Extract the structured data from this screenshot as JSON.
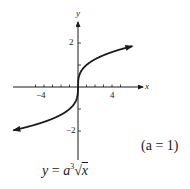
{
  "chart_data": {
    "type": "line",
    "title": "",
    "function": "y = a * cbrt(x)",
    "parameter": {
      "name": "a",
      "value": 1
    },
    "formula_label": "y = a∛x",
    "parameter_label": "(a = 1)",
    "xlabel": "x",
    "ylabel": "y",
    "xlim": [
      -6.5,
      6.5
    ],
    "ylim": [
      -3,
      3
    ],
    "x_ticks": [
      -5,
      -4,
      -3,
      -2,
      -1,
      1,
      2,
      3,
      4,
      5
    ],
    "x_tick_labels": [
      {
        "value": -4,
        "label": "−4"
      },
      {
        "value": 4,
        "label": "4"
      }
    ],
    "y_ticks": [
      -2,
      -1,
      1,
      2
    ],
    "y_tick_labels": [
      {
        "value": 2,
        "label": "2"
      },
      {
        "value": -2,
        "label": "−2"
      }
    ],
    "grid": false,
    "arrows": "both ends",
    "x": [
      -6,
      -5,
      -4,
      -3,
      -2,
      -1,
      -0.5,
      -0.1,
      0,
      0.1,
      0.5,
      1,
      2,
      3,
      4,
      5,
      6
    ],
    "values": [
      -1.817,
      -1.71,
      -1.587,
      -1.442,
      -1.26,
      -1.0,
      -0.794,
      -0.464,
      0,
      0.464,
      0.794,
      1.0,
      1.26,
      1.442,
      1.587,
      1.71,
      1.817
    ]
  },
  "labels": {
    "x_axis": "x",
    "y_axis": "y",
    "x_tick_neg4": "−4",
    "x_tick_4": "4",
    "y_tick_2": "2",
    "y_tick_neg2": "−2",
    "formula_y": "y",
    "formula_eq": " = ",
    "formula_a": "a",
    "formula_root_index": "3",
    "formula_x": "x",
    "parameter": "(a = 1)"
  }
}
